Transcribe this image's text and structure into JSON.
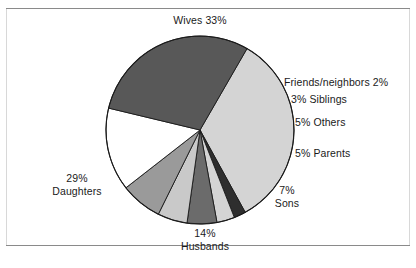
{
  "figure": {
    "background_color": "#ffffff",
    "rule_color": "#8a8a8a",
    "text_color": "#1a1a1a"
  },
  "chart_data": {
    "type": "pie",
    "title": "",
    "subtitle": "",
    "xlabel": "",
    "ylabel": "",
    "legend_position": "none",
    "grid": false,
    "total_percent": 98,
    "start_angle_deg": -60,
    "direction": "clockwise",
    "categories": [
      "Wives",
      "Friends/neighbors",
      "Siblings",
      "Others",
      "Parents",
      "Sons",
      "Husbands",
      "Daughters"
    ],
    "values": [
      33,
      2,
      3,
      5,
      5,
      7,
      14,
      29
    ],
    "colors": [
      "#d4d4d4",
      "#2e2e2e",
      "#d4d4d4",
      "#6b6b6b",
      "#c9c9c9",
      "#9a9a9a",
      "#ffffff",
      "#585858"
    ],
    "slices": [
      {
        "label": "Wives",
        "value": 33,
        "display": "Wives 33%",
        "color": "#d4d4d4",
        "label_position": "top"
      },
      {
        "label": "Friends/neighbors",
        "value": 2,
        "display": "Friends/neighbors 2%",
        "color": "#2e2e2e",
        "label_position": "right"
      },
      {
        "label": "Siblings",
        "value": 3,
        "display": "3% Siblings",
        "color": "#d4d4d4",
        "label_position": "right"
      },
      {
        "label": "Others",
        "value": 5,
        "display": "5% Others",
        "color": "#6b6b6b",
        "label_position": "right"
      },
      {
        "label": "Parents",
        "value": 5,
        "display": "5% Parents",
        "color": "#c9c9c9",
        "label_position": "right"
      },
      {
        "label": "Sons",
        "value": 7,
        "display": "7%\nSons",
        "color": "#9a9a9a",
        "label_position": "lower-right"
      },
      {
        "label": "Husbands",
        "value": 14,
        "display": "14%\nHusbands",
        "color": "#ffffff",
        "label_position": "bottom"
      },
      {
        "label": "Daughters",
        "value": 29,
        "display": "29%\nDaughters",
        "color": "#585858",
        "label_position": "left"
      }
    ]
  },
  "labels": {
    "wives": "Wives 33%",
    "friends_neighbors": "Friends/neighbors 2%",
    "siblings": "3% Siblings",
    "others": "5% Others",
    "parents": "5% Parents",
    "sons_pct": "7%",
    "sons_name": "Sons",
    "husbands_pct": "14%",
    "husbands_name": "Husbands",
    "daughters_pct": "29%",
    "daughters_name": "Daughters"
  }
}
